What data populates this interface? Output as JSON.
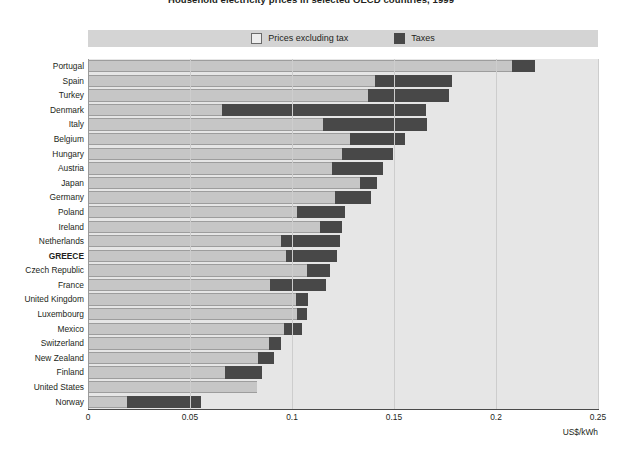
{
  "chart_data": {
    "type": "bar",
    "orientation": "horizontal",
    "stacked": true,
    "title": "Household electricity prices in selected OECD countries, 1999",
    "xlabel": "US$/kWh",
    "ylabel": "",
    "xlim": [
      0,
      0.25
    ],
    "xticks": [
      "0",
      "0.05",
      "0.1",
      "0.15",
      "0.2",
      "0.25"
    ],
    "xtick_values": [
      0,
      0.05,
      0.1,
      0.15,
      0.2,
      0.25
    ],
    "grid": true,
    "legend_position": "top",
    "highlight_category": "GREECE",
    "colors": {
      "prices_excluding_tax": "#c6c6c6",
      "taxes": "#484848",
      "plot_background": "#e6e6e6",
      "legend_background": "#d4d4d4"
    },
    "legend": [
      {
        "label": "Prices excluding tax",
        "swatch": "excl"
      },
      {
        "label": "Taxes",
        "swatch": "tax"
      }
    ],
    "categories": [
      "Portugal",
      "Spain",
      "Turkey",
      "Denmark",
      "Italy",
      "Belgium",
      "Hungary",
      "Austria",
      "Japan",
      "Germany",
      "Poland",
      "Ireland",
      "Netherlands",
      "GREECE",
      "Czech Republic",
      "France",
      "United Kingdom",
      "Luxembourg",
      "Mexico",
      "Switzerland",
      "New Zealand",
      "Finland",
      "United States",
      "Norway"
    ],
    "series": [
      {
        "name": "Prices excluding tax",
        "values": [
          0.2075,
          0.14,
          0.137,
          0.065,
          0.1145,
          0.128,
          0.124,
          0.119,
          0.133,
          0.1205,
          0.102,
          0.113,
          0.094,
          0.0965,
          0.107,
          0.0885,
          0.1015,
          0.102,
          0.0955,
          0.088,
          0.083,
          0.0665,
          0.0825,
          0.0185
        ]
      },
      {
        "name": "Taxes",
        "values": [
          0.011,
          0.038,
          0.0395,
          0.1,
          0.051,
          0.027,
          0.025,
          0.025,
          0.008,
          0.0175,
          0.0235,
          0.011,
          0.029,
          0.025,
          0.011,
          0.0275,
          0.006,
          0.005,
          0.009,
          0.006,
          0.0075,
          0.0185,
          0.0,
          0.0365
        ]
      }
    ],
    "totals": [
      0.2185,
      0.178,
      0.1765,
      0.165,
      0.1655,
      0.155,
      0.149,
      0.144,
      0.141,
      0.138,
      0.1255,
      0.124,
      0.123,
      0.1215,
      0.118,
      0.116,
      0.1075,
      0.107,
      0.1045,
      0.094,
      0.0905,
      0.085,
      0.0825,
      0.055
    ]
  }
}
